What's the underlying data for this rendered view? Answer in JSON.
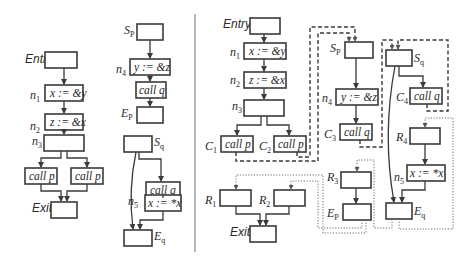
{
  "figure": {
    "left_panel": {
      "main": {
        "entry": "Entry",
        "n1": {
          "name": "n",
          "sub": "1",
          "code": "x := &y"
        },
        "n2": {
          "name": "n",
          "sub": "2",
          "code": "z := &x"
        },
        "n3": {
          "name": "n",
          "sub": "3"
        },
        "call_left": "call p",
        "call_right": "call p",
        "exit": "Exit"
      },
      "proc_p": {
        "start": {
          "name": "S",
          "sub": "P"
        },
        "n4": {
          "name": "n",
          "sub": "4",
          "code": "y := &z"
        },
        "call": "call q",
        "end": {
          "name": "E",
          "sub": "P"
        }
      },
      "proc_q": {
        "start": {
          "name": "S",
          "sub": "q"
        },
        "call": "call q",
        "n5": {
          "name": "n",
          "sub": "5",
          "code": "x := *x"
        },
        "end": {
          "name": "E",
          "sub": "q"
        }
      }
    },
    "right_panel": {
      "entry": "Entry",
      "n1": {
        "name": "n",
        "sub": "1",
        "code": "x := &y"
      },
      "n2": {
        "name": "n",
        "sub": "2",
        "code": "z := &x"
      },
      "n3": {
        "name": "n",
        "sub": "3"
      },
      "c1": {
        "name": "C",
        "sub": "1",
        "code": "call p"
      },
      "c2": {
        "name": "C",
        "sub": "2",
        "code": "call p"
      },
      "r1": {
        "name": "R",
        "sub": "1"
      },
      "r2": {
        "name": "R",
        "sub": "2"
      },
      "exit": "Exit",
      "sp": {
        "name": "S",
        "sub": "P"
      },
      "n4": {
        "name": "n",
        "sub": "4",
        "code": "y := &z"
      },
      "c3": {
        "name": "C",
        "sub": "3",
        "code": "call q"
      },
      "r3": {
        "name": "R",
        "sub": "3"
      },
      "ep": {
        "name": "E",
        "sub": "P"
      },
      "sq": {
        "name": "S",
        "sub": "q"
      },
      "c4": {
        "name": "C",
        "sub": "4",
        "code": "call q"
      },
      "r4": {
        "name": "R",
        "sub": "4"
      },
      "n5": {
        "name": "n",
        "sub": "5",
        "code": "x := *x"
      },
      "eq": {
        "name": "E",
        "sub": "q"
      }
    },
    "legend": {
      "solid": "intraprocedural edge",
      "dashed": "call edge",
      "dotted": "return edge"
    }
  }
}
